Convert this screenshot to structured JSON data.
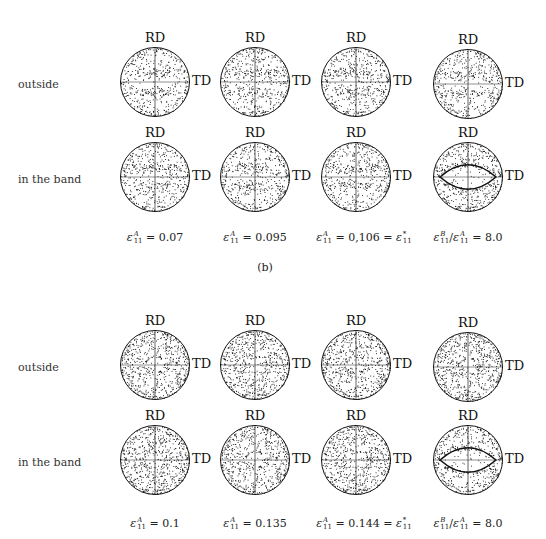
{
  "figure": {
    "panel_label": "(b)",
    "axis_labels": {
      "rd": "RD",
      "td": "TD"
    },
    "blocks": [
      {
        "rows": [
          {
            "label": "outside",
            "pattern": [
              "two-bands",
              "two-bands",
              "two-bands",
              "two-bands"
            ]
          },
          {
            "label": "in the band",
            "pattern": [
              "two-bands",
              "two-bands",
              "two-bands-tight",
              "lens"
            ]
          }
        ],
        "captions": [
          {
            "sym": "ε",
            "sub": "11",
            "sup": "A",
            "text": " = 0.07"
          },
          {
            "sym": "ε",
            "sub": "11",
            "sup": "A",
            "text": " = 0.095"
          },
          {
            "sym": "ε",
            "sub": "11",
            "sup": "A",
            "text": " = 0,106 = ε",
            "tail_sub": "11",
            "tail_sup": "*"
          },
          {
            "sym": "ε",
            "sub": "11",
            "sup": "B",
            "text": "/ε",
            "mid_sub": "11",
            "mid_sup": "A",
            "tail": " = 8.0"
          }
        ]
      },
      {
        "rows": [
          {
            "label": "outside",
            "pattern": [
              "ring",
              "ring",
              "ring",
              "ring"
            ]
          },
          {
            "label": "in the band",
            "pattern": [
              "ring",
              "ring",
              "ring-wide",
              "lens"
            ]
          }
        ],
        "captions": [
          {
            "sym": "ε",
            "sub": "11",
            "sup": "A",
            "text": " = 0.1"
          },
          {
            "sym": "ε",
            "sub": "11",
            "sup": "A",
            "text": " = 0.135"
          },
          {
            "sym": "ε",
            "sub": "11",
            "sup": "A",
            "text": " = 0.144 = ε",
            "tail_sub": "11",
            "tail_sup": "*"
          },
          {
            "sym": "ε",
            "sub": "11",
            "sup": "B",
            "text": "/ε",
            "mid_sub": "11",
            "mid_sup": "A",
            "tail": " = 8.0"
          }
        ]
      }
    ]
  },
  "labels": {
    "row_outside": "outside",
    "row_band": "in the band",
    "rd": "RD",
    "td": "TD",
    "panel_b": "(b)",
    "cap_top": [
      "0.07",
      "0.095",
      "0,106",
      "8.0"
    ],
    "cap_bottom": [
      "0.1",
      "0.135",
      "0.144",
      "8.0"
    ]
  }
}
